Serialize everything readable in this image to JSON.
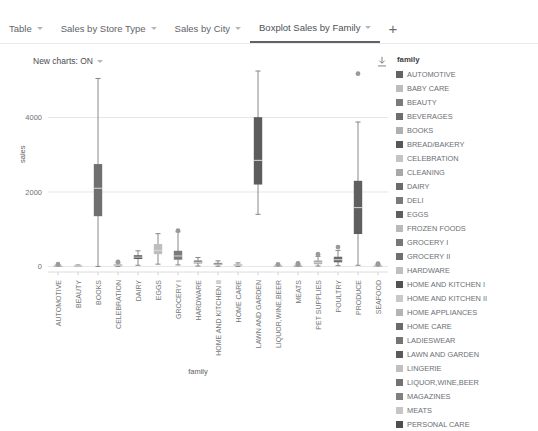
{
  "tabs": [
    {
      "label": "Table",
      "active": false,
      "caret": "chevron-down-icon"
    },
    {
      "label": "Sales by Store Type",
      "active": false,
      "caret": "chevron-down-icon"
    },
    {
      "label": "Sales by City",
      "active": false,
      "caret": "chevron-down-icon"
    },
    {
      "label": "Boxplot Sales by Family",
      "active": true,
      "caret": "chevron-down-icon"
    }
  ],
  "add_tab_label": "+",
  "toolbar": {
    "new_charts_label": "New charts: ON",
    "new_charts_value": "ON",
    "download_icon": "download-icon"
  },
  "legend": {
    "title": "family",
    "items": [
      {
        "label": "AUTOMOTIVE",
        "color": "#636363"
      },
      {
        "label": "BABY CARE",
        "color": "#bdbdbd"
      },
      {
        "label": "BEAUTY",
        "color": "#7b7b7b"
      },
      {
        "label": "BEVERAGES",
        "color": "#6e6e6e"
      },
      {
        "label": "BOOKS",
        "color": "#b0b0b0"
      },
      {
        "label": "BREAD/BAKERY",
        "color": "#575757"
      },
      {
        "label": "CELEBRATION",
        "color": "#c4c4c4"
      },
      {
        "label": "CLEANING",
        "color": "#a8a8a8"
      },
      {
        "label": "DAIRY",
        "color": "#6b6b6b"
      },
      {
        "label": "DELI",
        "color": "#7a7a7a"
      },
      {
        "label": "EGGS",
        "color": "#5e5e5e"
      },
      {
        "label": "FROZEN FOODS",
        "color": "#bababa"
      },
      {
        "label": "GROCERY I",
        "color": "#777777"
      },
      {
        "label": "GROCERY II",
        "color": "#6f6f6f"
      },
      {
        "label": "HARDWARE",
        "color": "#bfbfbf"
      },
      {
        "label": "HOME AND KITCHEN I",
        "color": "#525252"
      },
      {
        "label": "HOME AND KITCHEN II",
        "color": "#c9c9c9"
      },
      {
        "label": "HOME APPLIANCES",
        "color": "#b4b4b4"
      },
      {
        "label": "HOME CARE",
        "color": "#6a6a6a"
      },
      {
        "label": "LADIESWEAR",
        "color": "#747474"
      },
      {
        "label": "LAWN AND GARDEN",
        "color": "#5a5a5a"
      },
      {
        "label": "LINGERIE",
        "color": "#c0c0c0"
      },
      {
        "label": "LIQUOR,WINE,BEER",
        "color": "#727272"
      },
      {
        "label": "MAGAZINES",
        "color": "#808080"
      },
      {
        "label": "MEATS",
        "color": "#c6c6c6"
      },
      {
        "label": "PERSONAL CARE",
        "color": "#4f4f4f"
      }
    ]
  },
  "chart_data": {
    "type": "box",
    "title": "",
    "xlabel": "family",
    "ylabel": "sales",
    "ylim": [
      -150,
      5600
    ],
    "yticks": [
      0,
      2000,
      4000
    ],
    "ytick_labels": [
      "0",
      "2000",
      "4000"
    ],
    "grid": true,
    "legend_position": "right",
    "categories": [
      "AUTOMOTIVE",
      "BEAUTY",
      "BOOKS",
      "CELEBRATION",
      "DAIRY",
      "EGGS",
      "GROCERY I",
      "HARDWARE",
      "HOME AND KITCHEN II",
      "HOME CARE",
      "LAWN AND GARDEN",
      "LIQUOR,WINE,BEER",
      "MEATS",
      "PET SUPPLIES",
      "POULTRY",
      "PRODUCE",
      "SEAFOOD"
    ],
    "boxes": [
      {
        "category": "AUTOMOTIVE",
        "color": "#8c8c8c",
        "min": 0,
        "q1": 5,
        "median": 15,
        "q3": 25,
        "max": 45,
        "outliers": [
          60
        ]
      },
      {
        "category": "BEAUTY",
        "color": "#a9a9a9",
        "min": 0,
        "q1": 5,
        "median": 10,
        "q3": 20,
        "max": 40,
        "outliers": []
      },
      {
        "category": "BOOKS",
        "color": "#6f6f6f",
        "min": 0,
        "q1": 1350,
        "median": 2100,
        "q3": 2750,
        "max": 5050,
        "outliers": []
      },
      {
        "category": "CELEBRATION",
        "color": "#9e9e9e",
        "min": 0,
        "q1": 10,
        "median": 30,
        "q3": 55,
        "max": 95,
        "outliers": [
          120
        ]
      },
      {
        "category": "DAIRY",
        "color": "#575757",
        "min": 30,
        "q1": 200,
        "median": 250,
        "q3": 300,
        "max": 420,
        "outliers": []
      },
      {
        "category": "EGGS",
        "color": "#bdbdbd",
        "min": 60,
        "q1": 330,
        "median": 430,
        "q3": 600,
        "max": 880,
        "outliers": []
      },
      {
        "category": "GROCERY I",
        "color": "#7a7a7a",
        "min": 40,
        "q1": 180,
        "median": 280,
        "q3": 420,
        "max": 930,
        "outliers": [
          960
        ]
      },
      {
        "category": "HARDWARE",
        "color": "#808080",
        "min": 10,
        "q1": 80,
        "median": 110,
        "q3": 160,
        "max": 240,
        "outliers": []
      },
      {
        "category": "HOME AND KITCHEN II",
        "color": "#707070",
        "min": 5,
        "q1": 40,
        "median": 60,
        "q3": 95,
        "max": 150,
        "outliers": []
      },
      {
        "category": "HOME CARE",
        "color": "#9c9c9c",
        "min": 0,
        "q1": 20,
        "median": 35,
        "q3": 55,
        "max": 95,
        "outliers": []
      },
      {
        "category": "LAWN AND GARDEN",
        "color": "#5c5c5c",
        "min": 1400,
        "q1": 2200,
        "median": 2850,
        "q3": 4010,
        "max": 5250,
        "outliers": []
      },
      {
        "category": "LIQUOR,WINE,BEER",
        "color": "#8f8f8f",
        "min": 0,
        "q1": 5,
        "median": 12,
        "q3": 22,
        "max": 40,
        "outliers": [
          55
        ]
      },
      {
        "category": "MEATS",
        "color": "#7d7d7d",
        "min": 0,
        "q1": 8,
        "median": 15,
        "q3": 28,
        "max": 48,
        "outliers": [
          65,
          80
        ]
      },
      {
        "category": "PET SUPPLIES",
        "color": "#ababab",
        "min": 10,
        "q1": 60,
        "median": 100,
        "q3": 160,
        "max": 270,
        "outliers": [
          330
        ]
      },
      {
        "category": "POULTRY",
        "color": "#6b6b6b",
        "min": 20,
        "q1": 110,
        "median": 180,
        "q3": 260,
        "max": 430,
        "outliers": [
          520
        ]
      },
      {
        "category": "PRODUCE",
        "color": "#5f5f5f",
        "min": 30,
        "q1": 870,
        "median": 1580,
        "q3": 2300,
        "max": 3880,
        "outliers": [
          5180
        ]
      },
      {
        "category": "SEAFOOD",
        "color": "#999999",
        "min": 0,
        "q1": 5,
        "median": 12,
        "q3": 24,
        "max": 42,
        "outliers": [
          58,
          72
        ]
      }
    ]
  }
}
